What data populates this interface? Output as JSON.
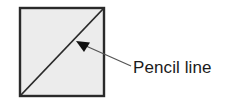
{
  "figure": {
    "label": "Pencil line",
    "colors": {
      "square_fill": "#ececec",
      "square_stroke": "#2a2a2a",
      "diagonal": "#2a2a2a",
      "leader_line": "#555555",
      "arrowhead": "#111111",
      "label_text": "#1a1a1a"
    }
  }
}
